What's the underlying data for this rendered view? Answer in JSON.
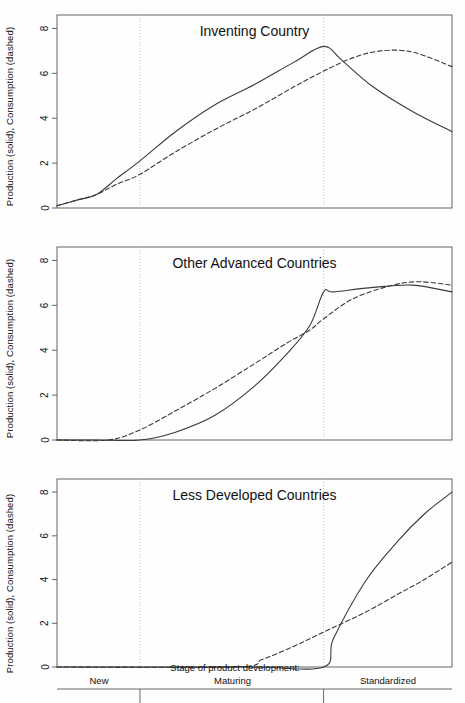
{
  "figure": {
    "background": "#fefefe",
    "line_color": "#3a3a3a",
    "axis_color": "#555555",
    "grid_color": "#bdbdbd"
  },
  "axis": {
    "ylabel": "Production (solid), Consumption (dashed)",
    "yticks": [
      "0",
      "2",
      "4",
      "6",
      "8"
    ],
    "ylim": [
      0,
      8.6
    ],
    "xlabel": "Stage of product development:",
    "stages": [
      "New",
      "Maturing",
      "Standardized"
    ],
    "stage_boundaries": [
      0.21,
      0.675
    ]
  },
  "panels": [
    {
      "title": "Inventing Country"
    },
    {
      "title": "Other Advanced Countries"
    },
    {
      "title": "Less Developed Countries"
    }
  ],
  "chart_data": {
    "type": "line",
    "xlabel": "Stage of product development:",
    "ylabel": "Production (solid), Consumption (dashed)",
    "ylim": [
      0,
      8.6
    ],
    "xlim": [
      0,
      1
    ],
    "grid": false,
    "legend": "encoded in y-axis label: solid = Production, dashed = Consumption",
    "annotations": [
      "Vertical dotted lines mark stage boundaries at x=0.21 (New -> Maturing) and x=0.675 (Maturing -> Standardized)"
    ],
    "x_stage_ticks": [
      "New",
      "Maturing",
      "Standardized"
    ],
    "panels": [
      {
        "title": "Inventing Country",
        "series": [
          {
            "name": "Production (solid)",
            "style": "solid",
            "x": [
              0.0,
              0.05,
              0.1,
              0.15,
              0.21,
              0.3,
              0.4,
              0.5,
              0.6,
              0.675,
              0.72,
              0.8,
              0.9,
              1.0
            ],
            "values": [
              0.1,
              0.35,
              0.6,
              1.3,
              2.1,
              3.4,
              4.6,
              5.5,
              6.5,
              7.2,
              6.6,
              5.4,
              4.3,
              3.4
            ]
          },
          {
            "name": "Consumption (dashed)",
            "style": "dashed",
            "x": [
              0.0,
              0.05,
              0.1,
              0.15,
              0.21,
              0.3,
              0.4,
              0.5,
              0.6,
              0.675,
              0.75,
              0.82,
              0.9,
              1.0
            ],
            "values": [
              0.1,
              0.35,
              0.6,
              1.05,
              1.5,
              2.5,
              3.5,
              4.4,
              5.4,
              6.1,
              6.7,
              7.0,
              6.95,
              6.3
            ]
          }
        ]
      },
      {
        "title": "Other Advanced Countries",
        "series": [
          {
            "name": "Production (solid)",
            "style": "solid",
            "x": [
              0.0,
              0.1,
              0.21,
              0.3,
              0.4,
              0.5,
              0.58,
              0.64,
              0.675,
              0.7,
              0.8,
              0.9,
              1.0
            ],
            "values": [
              0.0,
              0.0,
              0.0,
              0.35,
              1.1,
              2.4,
              3.8,
              5.1,
              6.6,
              6.6,
              6.8,
              6.9,
              6.6
            ]
          },
          {
            "name": "Consumption (dashed)",
            "style": "dashed",
            "x": [
              0.0,
              0.13,
              0.21,
              0.3,
              0.4,
              0.5,
              0.58,
              0.64,
              0.675,
              0.75,
              0.85,
              0.92,
              1.0
            ],
            "values": [
              0.0,
              0.0,
              0.45,
              1.3,
              2.3,
              3.4,
              4.3,
              4.9,
              5.4,
              6.3,
              6.9,
              7.05,
              6.9
            ]
          }
        ]
      },
      {
        "title": "Less Developed Countries",
        "series": [
          {
            "name": "Production (solid)",
            "style": "solid",
            "x": [
              0.0,
              0.21,
              0.5,
              0.675,
              0.7,
              0.78,
              0.86,
              0.93,
              1.0
            ],
            "values": [
              0.0,
              0.0,
              0.0,
              0.0,
              1.3,
              3.9,
              5.7,
              7.0,
              8.0
            ]
          },
          {
            "name": "Consumption (dashed)",
            "style": "dashed",
            "x": [
              0.0,
              0.45,
              0.52,
              0.6,
              0.675,
              0.78,
              0.86,
              0.93,
              1.0
            ],
            "values": [
              0.0,
              0.0,
              0.35,
              0.95,
              1.6,
              2.5,
              3.3,
              4.0,
              4.8
            ]
          }
        ]
      }
    ]
  }
}
